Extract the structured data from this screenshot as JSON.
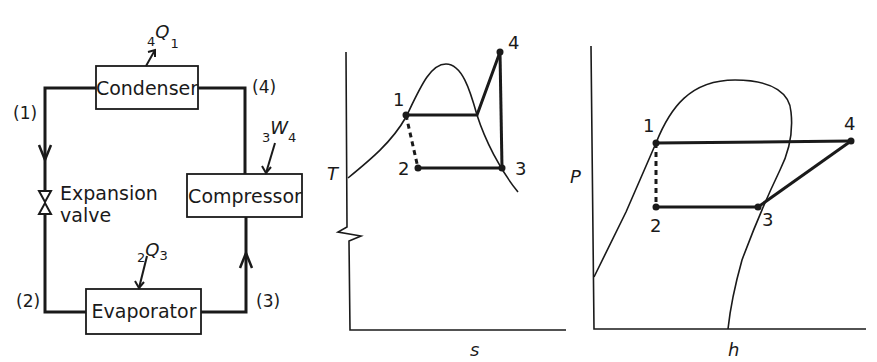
{
  "schematic": {
    "components": {
      "condenser": "Condenser",
      "compressor": "Compressor",
      "evaporator": "Evaporator",
      "valve_line1": "Expansion",
      "valve_line2": "valve"
    },
    "states": {
      "s1": "(1)",
      "s2": "(2)",
      "s3": "(3)",
      "s4": "(4)"
    },
    "energy": {
      "heat_out": {
        "pre": "4",
        "sym": "Q",
        "sub": "1"
      },
      "work_in": {
        "pre": "3",
        "sym": "W",
        "sub": "4"
      },
      "heat_in": {
        "pre": "2",
        "sym": "Q",
        "sub": "3"
      }
    }
  },
  "ts_diagram": {
    "x_label": "s",
    "y_label": "T",
    "points": [
      "1",
      "2",
      "3",
      "4"
    ]
  },
  "ph_diagram": {
    "x_label": "h",
    "y_label": "P",
    "points": [
      "1",
      "2",
      "3",
      "4"
    ]
  },
  "colors": {
    "ink": "#1a1a1a",
    "background": "#ffffff"
  }
}
